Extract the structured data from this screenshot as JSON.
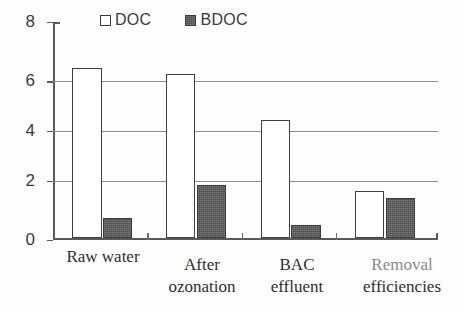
{
  "chart_data": {
    "type": "bar",
    "title": "",
    "xlabel": "",
    "ylabel": "",
    "ylim": [
      0,
      8
    ],
    "yticks": [
      0,
      2,
      4,
      6,
      8
    ],
    "grid": "horizontal gridlines at 2, 4 and 6",
    "legend_position": "top-center",
    "categories": [
      "Raw water",
      "After ozonation",
      "BAC effluent",
      "Removal efficiencies"
    ],
    "category_lines": [
      [
        "Raw water",
        ""
      ],
      [
        "After",
        "ozonation"
      ],
      [
        "BAC",
        "effluent"
      ],
      [
        "Removal",
        "efficiencies"
      ]
    ],
    "series": [
      {
        "name": "DOC",
        "style": "open",
        "color": "#ffffff",
        "edge_color": "#3f3f3f",
        "values": [
          6.25,
          6.05,
          4.35,
          1.75
        ]
      },
      {
        "name": "BDOC",
        "style": "filled",
        "color": "#5d5d5d",
        "edge_color": "#3a3a3a",
        "values": [
          0.75,
          1.95,
          0.5,
          1.5
        ]
      }
    ]
  },
  "axis": {
    "y_tick_labels": [
      "8",
      "6",
      "4",
      "2",
      "0"
    ],
    "y_tick_values": [
      8,
      6,
      4,
      2,
      0
    ]
  },
  "legend": {
    "entries": [
      {
        "label": "DOC",
        "swatch": "open-square-icon"
      },
      {
        "label": "BDOC",
        "swatch": "filled-square-icon"
      }
    ]
  }
}
